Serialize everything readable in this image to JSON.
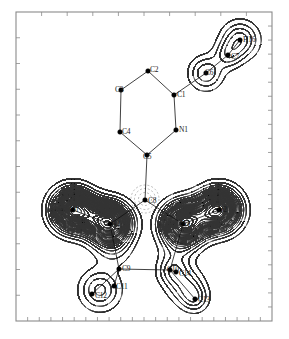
{
  "figure": {
    "type": "deformation-electron-density-map",
    "caption": "",
    "frame": {
      "x": 16,
      "y": 12,
      "width": 256,
      "height": 309,
      "color": "#8a8a8a"
    },
    "background": "#ffffff",
    "line_color": "#111111",
    "positive_contour_color": "#333333",
    "negative_contour_color": "#777777",
    "negative_contour_dash": "2,2"
  },
  "axes": {
    "show_labels": false,
    "tick_color": "#8a8a8a",
    "top_ticks": 10,
    "bottom_ticks": 22,
    "left_ticks": 12,
    "right_ticks": 22
  },
  "atoms": [
    {
      "id": "N1",
      "label": "N1",
      "x": 176,
      "y": 130,
      "lx": 179,
      "ly": 126
    },
    {
      "id": "C1",
      "label": "C1",
      "x": 174,
      "y": 95,
      "lx": 177,
      "ly": 91
    },
    {
      "id": "C2",
      "label": "C2",
      "x": 148,
      "y": 71,
      "lx": 150,
      "ly": 66
    },
    {
      "id": "C3",
      "label": "C3",
      "x": 121,
      "y": 90,
      "lx": 115,
      "ly": 86
    },
    {
      "id": "C4",
      "label": "C4",
      "x": 120,
      "y": 132,
      "lx": 122,
      "ly": 128
    },
    {
      "id": "C5",
      "label": "C5",
      "x": 147,
      "y": 155,
      "lx": 143,
      "ly": 153
    },
    {
      "id": "C6",
      "label": "C6",
      "x": 206,
      "y": 73,
      "lx": 205,
      "ly": 69
    },
    {
      "id": "C7",
      "label": "C7",
      "x": 228,
      "y": 55,
      "lx": 231,
      "ly": 53
    },
    {
      "id": "H16",
      "label": "H16",
      "x": 240,
      "y": 40,
      "lx": 243,
      "ly": 36
    },
    {
      "id": "C8",
      "label": "C8",
      "x": 145,
      "y": 200,
      "lx": 148,
      "ly": 197
    },
    {
      "id": "O1",
      "label": "O1",
      "x": 73,
      "y": 210,
      "lx": 70,
      "ly": 206
    },
    {
      "id": "N2",
      "label": "N2",
      "x": 110,
      "y": 224,
      "lx": 111,
      "ly": 220
    },
    {
      "id": "N3",
      "label": "N3",
      "x": 183,
      "y": 224,
      "lx": 181,
      "ly": 220
    },
    {
      "id": "O2",
      "label": "O2",
      "x": 219,
      "y": 210,
      "lx": 218,
      "ly": 206
    },
    {
      "id": "C9",
      "label": "C9",
      "x": 119,
      "y": 269,
      "lx": 122,
      "ly": 265
    },
    {
      "id": "C10",
      "label": "C10",
      "x": 170,
      "y": 270,
      "lx": 167,
      "ly": 266
    },
    {
      "id": "C11",
      "label": "C11",
      "x": 114,
      "y": 286,
      "lx": 116,
      "ly": 283
    },
    {
      "id": "C12",
      "label": "C12",
      "x": 92,
      "y": 294,
      "lx": 95,
      "ly": 292
    },
    {
      "id": "C13",
      "label": "C13",
      "x": 195,
      "y": 299,
      "lx": 198,
      "ly": 296
    },
    {
      "id": "C14",
      "label": "C14",
      "x": 176,
      "y": 272,
      "lx": 179,
      "ly": 270
    }
  ],
  "bonds": [
    [
      "N1",
      "C1"
    ],
    [
      "C1",
      "C2"
    ],
    [
      "C2",
      "C3"
    ],
    [
      "C3",
      "C4"
    ],
    [
      "C4",
      "C5"
    ],
    [
      "C5",
      "N1"
    ],
    [
      "C1",
      "C6"
    ],
    [
      "C6",
      "C7"
    ],
    [
      "C7",
      "H16"
    ],
    [
      "C5",
      "C8"
    ],
    [
      "C8",
      "N2"
    ],
    [
      "C8",
      "N3"
    ],
    [
      "N2",
      "O1"
    ],
    [
      "N3",
      "O2"
    ],
    [
      "N2",
      "C9"
    ],
    [
      "N3",
      "C10"
    ],
    [
      "C9",
      "C10"
    ],
    [
      "C9",
      "C11"
    ],
    [
      "C9",
      "C12"
    ],
    [
      "C10",
      "C14"
    ],
    [
      "C10",
      "C13"
    ]
  ],
  "contour_groups": [
    {
      "name": "O1-lobe",
      "center_x": 73,
      "center_y": 210,
      "levels": 11,
      "type": "positive"
    },
    {
      "name": "N2-lobe",
      "center_x": 110,
      "center_y": 224,
      "levels": 11,
      "type": "positive"
    },
    {
      "name": "N3-lobe",
      "center_x": 183,
      "center_y": 224,
      "levels": 11,
      "type": "positive"
    },
    {
      "name": "O2-lobe",
      "center_x": 219,
      "center_y": 210,
      "levels": 11,
      "type": "positive"
    },
    {
      "name": "C8-hole",
      "center_x": 145,
      "center_y": 200,
      "levels": 3,
      "type": "negative"
    },
    {
      "name": "C6-lobe",
      "center_x": 206,
      "center_y": 73,
      "levels": 1,
      "type": "positive"
    },
    {
      "name": "H16-lobe",
      "center_x": 240,
      "center_y": 40,
      "levels": 1,
      "type": "positive"
    },
    {
      "name": "C12-lobe",
      "center_x": 104,
      "center_y": 292,
      "levels": 1,
      "type": "positive"
    },
    {
      "name": "C13-lobe",
      "center_x": 186,
      "center_y": 288,
      "levels": 1,
      "type": "positive"
    }
  ],
  "chart_data": {
    "type": "contour",
    "title": "",
    "xlabel": "",
    "ylabel": "",
    "legend": [],
    "grid": false,
    "series": [
      {
        "name": "positive density",
        "style": "solid",
        "color": "#333333"
      },
      {
        "name": "negative density",
        "style": "dashed",
        "color": "#777777"
      }
    ],
    "peaks": [
      {
        "label": "O1",
        "x": 73,
        "y": 210,
        "rings": 11,
        "sign": "+"
      },
      {
        "label": "N2",
        "x": 110,
        "y": 224,
        "rings": 11,
        "sign": "+"
      },
      {
        "label": "N3",
        "x": 183,
        "y": 224,
        "rings": 11,
        "sign": "+"
      },
      {
        "label": "O2",
        "x": 219,
        "y": 210,
        "rings": 11,
        "sign": "+"
      },
      {
        "label": "C8",
        "x": 145,
        "y": 200,
        "rings": 3,
        "sign": "-"
      }
    ]
  }
}
